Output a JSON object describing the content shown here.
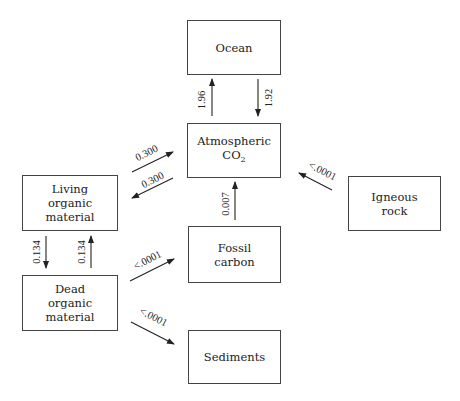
{
  "diagram": {
    "type": "carbon-cycle-flow",
    "nodes": {
      "ocean": {
        "label": "Ocean"
      },
      "atmospheric": {
        "label_main": "Atmospheric",
        "label_sub_prefix": "CO",
        "label_sub": "2"
      },
      "living": {
        "line1": "Living",
        "line2": "organic",
        "line3": "material"
      },
      "dead": {
        "line1": "Dead",
        "line2": "organic",
        "line3": "material"
      },
      "fossil": {
        "line1": "Fossil",
        "line2": "carbon"
      },
      "igneous": {
        "line1": "Igneous",
        "line2": "rock"
      },
      "sediments": {
        "label": "Sediments"
      }
    },
    "edges": [
      {
        "from": "atmospheric",
        "to": "ocean",
        "value": "1.96"
      },
      {
        "from": "ocean",
        "to": "atmospheric",
        "value": "1.92"
      },
      {
        "from": "living",
        "to": "atmospheric",
        "value": "0.300"
      },
      {
        "from": "atmospheric",
        "to": "living",
        "value": "0.300"
      },
      {
        "from": "fossil",
        "to": "atmospheric",
        "value": "0.007"
      },
      {
        "from": "igneous",
        "to": "atmospheric",
        "value": "<.0001"
      },
      {
        "from": "living",
        "to": "dead",
        "value": "0.134"
      },
      {
        "from": "dead",
        "to": "living",
        "value": "0.134"
      },
      {
        "from": "dead",
        "to": "fossil",
        "value": "<.0001"
      },
      {
        "from": "dead",
        "to": "sediments",
        "value": "<.0001"
      }
    ]
  }
}
